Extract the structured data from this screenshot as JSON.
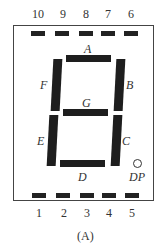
{
  "diagram": {
    "type": "seven-segment-display-pinout",
    "caption": "(A)",
    "top_pins": [
      "10",
      "9",
      "8",
      "7",
      "6"
    ],
    "bottom_pins": [
      "1",
      "2",
      "3",
      "4",
      "5"
    ],
    "segments": {
      "A": "A",
      "B": "B",
      "C": "C",
      "D": "D",
      "E": "E",
      "F": "F",
      "G": "G"
    },
    "decimal_point": "DP",
    "colors": {
      "segment": "#1e1e1e",
      "outline": "#444444",
      "text": "#333333"
    }
  }
}
